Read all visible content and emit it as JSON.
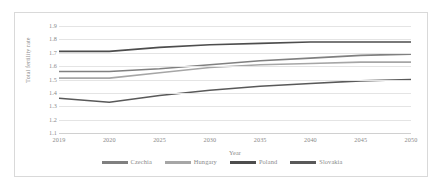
{
  "chart_data": {
    "type": "line",
    "title": "",
    "xlabel": "Year",
    "ylabel": "Total fertility rate",
    "x": [
      2019,
      2020,
      2025,
      2030,
      2035,
      2040,
      2045,
      2050
    ],
    "xtick_labels": [
      "2019",
      "2020",
      "2025",
      "2030",
      "2035",
      "2040",
      "2045",
      "2050"
    ],
    "ytick_labels": [
      "1.9",
      "1.8",
      "1.7",
      "1.6",
      "1.5",
      "1.4",
      "1.3",
      "1.2",
      "1.1"
    ],
    "ylim": [
      1.1,
      1.9
    ],
    "ytick_step": 0.1,
    "grid": true,
    "legend_position": "bottom",
    "series": [
      {
        "name": "Czechia",
        "color": "#808080",
        "values": [
          1.56,
          1.56,
          1.58,
          1.61,
          1.64,
          1.66,
          1.68,
          1.69
        ]
      },
      {
        "name": "Hungary",
        "color": "#a6a6a6",
        "values": [
          1.51,
          1.51,
          1.55,
          1.59,
          1.61,
          1.62,
          1.63,
          1.63
        ]
      },
      {
        "name": "Poland",
        "color": "#4d4d4d",
        "values": [
          1.71,
          1.71,
          1.74,
          1.76,
          1.77,
          1.78,
          1.78,
          1.78
        ]
      },
      {
        "name": "Slovakia",
        "color": "#595959",
        "values": [
          1.36,
          1.33,
          1.38,
          1.42,
          1.45,
          1.47,
          1.49,
          1.5
        ]
      }
    ]
  },
  "legend": {
    "items": [
      {
        "label": "Czechia"
      },
      {
        "label": "Hungary"
      },
      {
        "label": "Poland"
      },
      {
        "label": "Slovakia"
      }
    ]
  }
}
